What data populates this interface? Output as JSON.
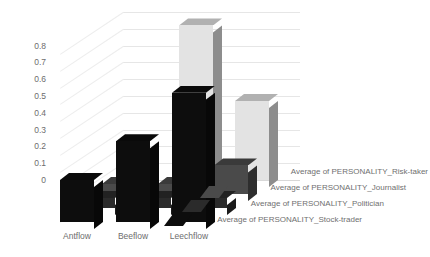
{
  "chart_data": {
    "type": "bar",
    "title": "",
    "xlabel": "",
    "ylabel": "",
    "categories": [
      "Antflow",
      "Beeflow",
      "Leechflow"
    ],
    "ylim": [
      0,
      1.0
    ],
    "yticks": [
      "0.8",
      "0.7",
      "0.6",
      "0.5",
      "0.4",
      "0.3",
      "0.2",
      "0.1",
      "0"
    ],
    "ytick_values": [
      0.8,
      0.7,
      0.6,
      0.5,
      0.4,
      0.3,
      0.2,
      0.1,
      0
    ],
    "grid": true,
    "three_d": true,
    "legend_position": "right",
    "series": [
      {
        "name": "Average of PERSONALITY_Risk-taker",
        "color": "#e3e3e3",
        "values": [
          0.0,
          0.92,
          0.47
        ]
      },
      {
        "name": "Average of PERSONALITY_Journalist",
        "color": "#4a4a4a",
        "values": [
          0.06,
          0.06,
          0.17
        ]
      },
      {
        "name": "Average of PERSONALITY_Politician",
        "color": "#2b2b2b",
        "values": [
          0.06,
          0.06,
          0.06
        ]
      },
      {
        "name": "Average of PERSONALITY_Stock-trader",
        "color": "#0d0d0d",
        "values": [
          0.25,
          0.48,
          0.77
        ]
      }
    ]
  },
  "legend": {
    "items": [
      "Average of PERSONALITY_Risk-taker",
      "Average of PERSONALITY_Journalist",
      "Average of PERSONALITY_Politician",
      "Average of PERSONALITY_Stock-trader"
    ]
  },
  "colors": {
    "grid": "#e6e6e6",
    "text": "#6d6d6d",
    "background": "#ffffff",
    "bar_light": "#e3e3e3",
    "bar_mid": "#4a4a4a",
    "bar_dark": "#2b2b2b",
    "bar_black": "#0d0d0d"
  }
}
